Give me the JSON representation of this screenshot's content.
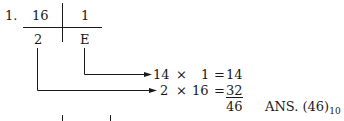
{
  "problem": {
    "number": "1.",
    "table": {
      "top_left": "16",
      "top_right": "1",
      "bottom_left": "2",
      "bottom_right": "E"
    },
    "calc": [
      {
        "a": "14",
        "op": "×",
        "b": "1",
        "eq": "=",
        "result": "14"
      },
      {
        "a": "2",
        "op": "×",
        "b": "16",
        "eq": "=",
        "result": "32"
      }
    ],
    "sum": "46",
    "answer": {
      "label": "ANS.",
      "value": "(46)",
      "base": "10"
    }
  }
}
